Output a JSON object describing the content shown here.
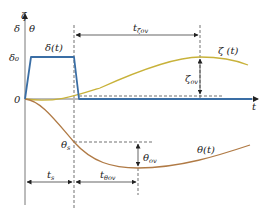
{
  "axes": {
    "y_labels": {
      "zeta": "ζ",
      "delta": "δ",
      "theta": "θ"
    },
    "x_label": "t",
    "zero_label": "0",
    "delta0_label": "δ₀"
  },
  "curves": {
    "delta": {
      "label": "δ(t)",
      "color": "#3a6ea5"
    },
    "zeta": {
      "label": "ζ (t)",
      "color": "#c8b23a"
    },
    "theta": {
      "label": "θ(t)",
      "color": "#b07a45"
    }
  },
  "annotations": {
    "t_zeta_ov": "t",
    "t_zeta_ov_sub": "ζov",
    "zeta_ov": "ζ",
    "zeta_ov_sub": "ov",
    "theta_s": "θ",
    "theta_s_sub": "s",
    "theta_ov": "θ",
    "theta_ov_sub": "ov",
    "t_s": "t",
    "t_s_sub": "s",
    "t_theta_ov": "t",
    "t_theta_ov_sub": "θov"
  }
}
